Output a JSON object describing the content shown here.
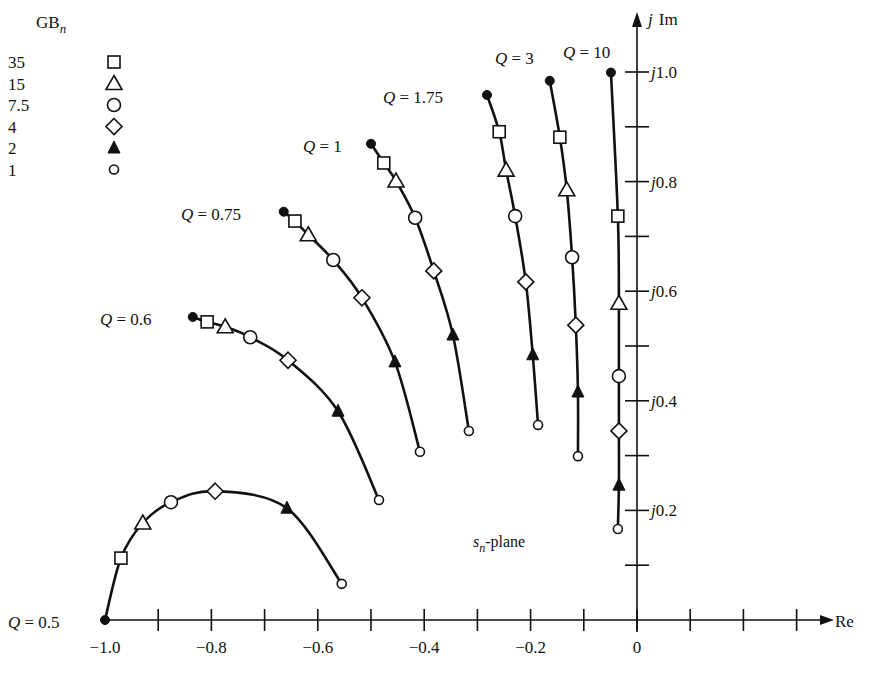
{
  "chart_data": {
    "type": "scatter",
    "title": "",
    "plane_label": "s_n-plane",
    "xlabel": "Re",
    "ylabel": "j Im",
    "xlim": [
      -1.0,
      0.3
    ],
    "ylim": [
      0.0,
      1.0
    ],
    "grid": false,
    "x_ticks": [
      -1.0,
      -0.9,
      -0.8,
      -0.7,
      -0.6,
      -0.5,
      -0.4,
      -0.3,
      -0.2,
      -0.1,
      0,
      0.1,
      0.2,
      0.3
    ],
    "x_tick_labels": [
      {
        "value": -1.0,
        "label": "−1.0"
      },
      {
        "value": -0.8,
        "label": "−0.8"
      },
      {
        "value": -0.6,
        "label": "−0.6"
      },
      {
        "value": -0.4,
        "label": "−0.4"
      },
      {
        "value": -0.2,
        "label": "−0.2"
      },
      {
        "value": 0,
        "label": "0"
      }
    ],
    "y_ticks": [
      0.1,
      0.2,
      0.3,
      0.4,
      0.5,
      0.6,
      0.7,
      0.8,
      0.9,
      1.0
    ],
    "y_tick_labels": [
      {
        "value": 1.0,
        "label": "j1.0"
      },
      {
        "value": 0.8,
        "label": "j0.8"
      },
      {
        "value": 0.6,
        "label": "j0.6"
      },
      {
        "value": 0.4,
        "label": "j0.4"
      },
      {
        "value": 0.2,
        "label": "j0.2"
      }
    ],
    "legend": {
      "title": "GB_n",
      "position": "top-left",
      "entries": [
        {
          "label": "35",
          "marker": "open-square"
        },
        {
          "label": "15",
          "marker": "open-triangle"
        },
        {
          "label": "7.5",
          "marker": "open-circle"
        },
        {
          "label": "4",
          "marker": "open-diamond"
        },
        {
          "label": "2",
          "marker": "filled-triangle"
        },
        {
          "label": "1",
          "marker": "small-open-circle"
        }
      ]
    },
    "markers_order": [
      "ideal",
      "35",
      "15",
      "7.5",
      "4",
      "2",
      "1"
    ],
    "series": [
      {
        "name": "Q = 0.5",
        "label": "Q = 0.5",
        "points": [
          {
            "gb": "inf",
            "re": -1.0,
            "im": 0.0
          },
          {
            "gb": "35",
            "re": -0.97,
            "im": 0.113
          },
          {
            "gb": "15",
            "re": -0.929,
            "im": 0.177
          },
          {
            "gb": "7.5",
            "re": -0.876,
            "im": 0.215
          },
          {
            "gb": "4",
            "re": -0.793,
            "im": 0.235
          },
          {
            "gb": "2",
            "re": -0.658,
            "im": 0.204
          },
          {
            "gb": "1",
            "re": -0.555,
            "im": 0.066
          }
        ]
      },
      {
        "name": "Q = 0.6",
        "label": "Q = 0.6",
        "points": [
          {
            "gb": "inf",
            "re": -0.835,
            "im": 0.553
          },
          {
            "gb": "35",
            "re": -0.808,
            "im": 0.544
          },
          {
            "gb": "15",
            "re": -0.774,
            "im": 0.535
          },
          {
            "gb": "7.5",
            "re": -0.727,
            "im": 0.516
          },
          {
            "gb": "4",
            "re": -0.656,
            "im": 0.474
          },
          {
            "gb": "2",
            "re": -0.562,
            "im": 0.381
          },
          {
            "gb": "1",
            "re": -0.485,
            "im": 0.219
          }
        ]
      },
      {
        "name": "Q = 0.75",
        "label": "Q = 0.75",
        "points": [
          {
            "gb": "inf",
            "re": -0.664,
            "im": 0.745
          },
          {
            "gb": "35",
            "re": -0.643,
            "im": 0.728
          },
          {
            "gb": "15",
            "re": -0.618,
            "im": 0.703
          },
          {
            "gb": "7.5",
            "re": -0.571,
            "im": 0.657
          },
          {
            "gb": "4",
            "re": -0.517,
            "im": 0.588
          },
          {
            "gb": "2",
            "re": -0.455,
            "im": 0.471
          },
          {
            "gb": "1",
            "re": -0.408,
            "im": 0.307
          }
        ]
      },
      {
        "name": "Q = 1",
        "label": "Q = 1",
        "points": [
          {
            "gb": "inf",
            "re": -0.5,
            "im": 0.869
          },
          {
            "gb": "35",
            "re": -0.476,
            "im": 0.834
          },
          {
            "gb": "15",
            "re": -0.453,
            "im": 0.801
          },
          {
            "gb": "7.5",
            "re": -0.417,
            "im": 0.734
          },
          {
            "gb": "4",
            "re": -0.382,
            "im": 0.637
          },
          {
            "gb": "2",
            "re": -0.346,
            "im": 0.52
          },
          {
            "gb": "1",
            "re": -0.316,
            "im": 0.345
          }
        ]
      },
      {
        "name": "Q = 1.75",
        "label": "Q = 1.75",
        "points": [
          {
            "gb": "inf",
            "re": -0.282,
            "im": 0.958
          },
          {
            "gb": "35",
            "re": -0.259,
            "im": 0.891
          },
          {
            "gb": "15",
            "re": -0.246,
            "im": 0.821
          },
          {
            "gb": "7.5",
            "re": -0.229,
            "im": 0.737
          },
          {
            "gb": "4",
            "re": -0.209,
            "im": 0.617
          },
          {
            "gb": "2",
            "re": -0.196,
            "im": 0.484
          },
          {
            "gb": "1",
            "re": -0.186,
            "im": 0.356
          }
        ]
      },
      {
        "name": "Q = 3",
        "label": "Q = 3",
        "points": [
          {
            "gb": "inf",
            "re": -0.164,
            "im": 0.984
          },
          {
            "gb": "35",
            "re": -0.145,
            "im": 0.881
          },
          {
            "gb": "15",
            "re": -0.132,
            "im": 0.785
          },
          {
            "gb": "7.5",
            "re": -0.122,
            "im": 0.662
          },
          {
            "gb": "4",
            "re": -0.115,
            "im": 0.538
          },
          {
            "gb": "2",
            "re": -0.111,
            "im": 0.416
          },
          {
            "gb": "1",
            "re": -0.111,
            "im": 0.299
          }
        ]
      },
      {
        "name": "Q = 10",
        "label": "Q = 10",
        "points": [
          {
            "gb": "inf",
            "re": -0.049,
            "im": 0.999
          },
          {
            "gb": "35",
            "re": -0.036,
            "im": 0.737
          },
          {
            "gb": "15",
            "re": -0.034,
            "im": 0.578
          },
          {
            "gb": "7.5",
            "re": -0.034,
            "im": 0.445
          },
          {
            "gb": "4",
            "re": -0.034,
            "im": 0.345
          },
          {
            "gb": "2",
            "re": -0.034,
            "im": 0.246
          },
          {
            "gb": "1",
            "re": -0.036,
            "im": 0.166
          }
        ]
      }
    ],
    "annotations": [
      {
        "text": "Q = 0.5",
        "anchor": "start of Q=0.5 curve, left"
      },
      {
        "text": "Q = 0.6",
        "anchor": "start of Q=0.6 curve, left"
      },
      {
        "text": "Q = 0.75",
        "anchor": "start of Q=0.75 curve, left"
      },
      {
        "text": "Q = 1",
        "anchor": "start of Q=1 curve, left"
      },
      {
        "text": "Q = 1.75",
        "anchor": "start of Q=1.75 curve, left"
      },
      {
        "text": "Q = 3",
        "anchor": "above Q=3 curve"
      },
      {
        "text": "Q = 10",
        "anchor": "above Q=10 curve"
      },
      {
        "text": "s_n-plane",
        "anchor": "lower right interior"
      }
    ]
  },
  "labels": {
    "legend_title_main": "GB",
    "legend_title_sub": "n",
    "plane_main": "s",
    "plane_sub": "n",
    "plane_suffix": "-plane",
    "x_axis": "Re",
    "y_axis_j": "j",
    "y_axis_im": "Im"
  },
  "layout": {
    "origin_px": [
      637,
      620
    ],
    "px_per_unit_x": 532,
    "px_per_unit_y": 548,
    "x_axis_end_px": 826,
    "y_axis_top_px": 12,
    "q_label_positions": [
      {
        "x": 8,
        "y": 628,
        "anchor": "start"
      },
      {
        "x": 100,
        "y": 325,
        "anchor": "start"
      },
      {
        "x": 181,
        "y": 220,
        "anchor": "start"
      },
      {
        "x": 303,
        "y": 152,
        "anchor": "start"
      },
      {
        "x": 383,
        "y": 103,
        "anchor": "start"
      },
      {
        "x": 495,
        "y": 64,
        "anchor": "start"
      },
      {
        "x": 563,
        "y": 58,
        "anchor": "start"
      }
    ],
    "legend_x_text": 8,
    "legend_x_marker": 114,
    "legend_title_y": 28,
    "legend_row_start_y": 62,
    "legend_row_gap": 21.5,
    "plane_label_pos": [
      473,
      547
    ]
  }
}
